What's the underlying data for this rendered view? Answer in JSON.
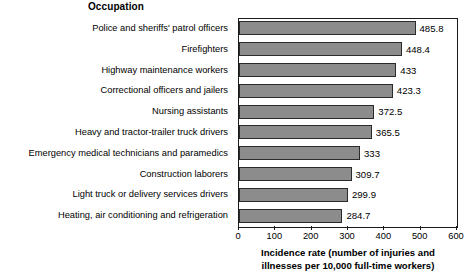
{
  "chart_data": {
    "type": "bar",
    "orientation": "horizontal",
    "title": "",
    "xlabel": "Incidence rate (number of injuries and illnesses per 10,000 full-time workers)",
    "xlabel_lines": [
      "Incidence rate (number of injuries and",
      "illnesses per 10,000 full-time workers)"
    ],
    "ylabel": "Occupation",
    "xlim": [
      0,
      600
    ],
    "xticks": [
      0,
      100,
      200,
      300,
      400,
      500,
      600
    ],
    "xtick_labels": [
      "0",
      "100",
      "200",
      "300",
      "400",
      "500",
      "600"
    ],
    "grid": false,
    "legend": null,
    "bar_color": "#8c8c8c",
    "bar_edge_color": "#2b2b2b",
    "categories": [
      "Police and sheriffs' patrol officers",
      "Firefighters",
      "Highway maintenance workers",
      "Correctional officers and jailers",
      "Nursing assistants",
      "Heavy and tractor-trailer truck drivers",
      "Emergency medical technicians and paramedics",
      "Construction laborers",
      "Light truck or delivery services drivers",
      "Heating, air conditioning and refrigeration"
    ],
    "values": [
      485.8,
      448.4,
      433,
      423.3,
      372.5,
      365.5,
      333,
      309.7,
      299.9,
      284.7
    ],
    "value_labels": [
      "485.8",
      "448.4",
      "433",
      "423.3",
      "372.5",
      "365.5",
      "333",
      "309.7",
      "299.9",
      "284.7"
    ]
  }
}
